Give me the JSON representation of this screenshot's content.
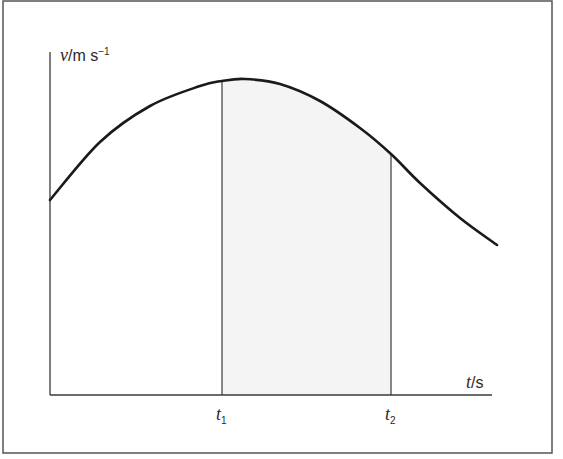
{
  "chart_data": {
    "type": "line",
    "title": "",
    "xlabel": "t/s",
    "ylabel": "v/m s⁻¹",
    "ylabel_parts": {
      "var": "v",
      "unit": "/m s",
      "exp": "−1"
    },
    "xlabel_parts": {
      "var": "t",
      "unit": "/s"
    },
    "ticks": [
      {
        "var": "t",
        "sub": "1"
      },
      {
        "var": "t",
        "sub": "2"
      }
    ],
    "shaded_region": {
      "from": "t1",
      "to": "t2"
    },
    "curve_points_px": [
      [
        50,
        200
      ],
      [
        100,
        142
      ],
      [
        150,
        106
      ],
      [
        200,
        86
      ],
      [
        222,
        81
      ],
      [
        245,
        79
      ],
      [
        280,
        84
      ],
      [
        320,
        101
      ],
      [
        360,
        128
      ],
      [
        391,
        154
      ],
      [
        420,
        183
      ],
      [
        460,
        218
      ],
      [
        497,
        245
      ]
    ],
    "grid": false,
    "legend": null
  },
  "colors": {
    "line": "#1a1a1a",
    "axis": "#3a3a3a",
    "shade": "#f4f4f4",
    "frame": "#555555"
  }
}
